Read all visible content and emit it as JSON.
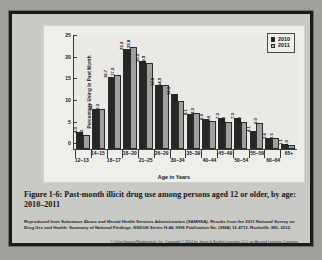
{
  "figure": {
    "caption": "Figure 1-6: Past-month illicit drug use among persons aged 12 or older, by age: 2010–2011",
    "source": "Reproduced from Substance Abuse and Mental Health Services Administration (SAMHSA). Results from the 2011 National Survey on Drug Use and Health: Summary of National Findings. NSDUH Series H-44, HHS Publication No. (SMA) 12-4713. Rockville, MD, 2012.",
    "copyright_line1": "© Ocha Images/Shutterstock, Inc. Copyright © 2014 by Jones & Bartlett Learning, LLC, an Ascend Learning Company",
    "copyright_line2": "www.jblearning.com"
  },
  "colors": {
    "series_2010": "#262626",
    "series_2011": "#9f9f9c",
    "panel_background": "#eeeeea",
    "frame_border": "#1b1b1b",
    "page_background": "#a0a09d"
  },
  "chart_data": {
    "type": "bar",
    "title": "",
    "xlabel": "Age in Years",
    "ylabel": "Percentage Using in Past Month",
    "ylim": [
      0,
      26.5
    ],
    "yticks": [
      0,
      5,
      10,
      15,
      20,
      25
    ],
    "ytick_labels": [
      "0",
      "5",
      "10",
      "15",
      "20",
      "25"
    ],
    "grid": false,
    "legend_position": "top-right",
    "categories": [
      "12–13",
      "14–15",
      "16–17",
      "18–20",
      "21–25",
      "26–29",
      "30–34",
      "35–39",
      "40–44",
      "45–49",
      "50–54",
      "55–59",
      "60–64",
      "65+"
    ],
    "series": [
      {
        "name": "2010",
        "color": "#262626",
        "values": [
          4.0,
          9.3,
          16.7,
          23.3,
          20.5,
          14.8,
          12.9,
          8.1,
          6.9,
          7.3,
          7.3,
          4.1,
          2.6,
          1.1
        ]
      },
      {
        "name": "2011",
        "color": "#9f9f9c",
        "values": [
          3.3,
          9.3,
          17.3,
          23.8,
          19.9,
          14.9,
          11.1,
          8.3,
          6.4,
          6.2,
          6.2,
          6.0,
          2.5,
          1.0
        ]
      }
    ]
  }
}
